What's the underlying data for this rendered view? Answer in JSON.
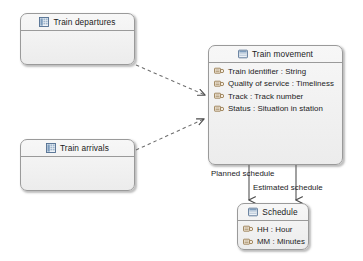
{
  "diagram": {
    "type": "uml-class-diagram",
    "background": "#ffffff",
    "box_fill": "#f0f0f0",
    "box_stroke": "#9a9a9a",
    "text_color": "#1b1b1b"
  },
  "classes": [
    {
      "id": "train-departures",
      "name": "Train departures",
      "icon": "table-icon",
      "attributes": [],
      "x": 20,
      "y": 13,
      "w": 115,
      "h": 52
    },
    {
      "id": "train-arrivals",
      "name": "Train arrivals",
      "icon": "table-icon",
      "attributes": [],
      "x": 20,
      "y": 139,
      "w": 115,
      "h": 52
    },
    {
      "id": "train-movement",
      "name": "Train movement",
      "icon": "window-icon",
      "attributes": [
        "Train identifier : String",
        "Quality of service : Timeliness",
        "Track : Track number",
        "Status : Situation in station"
      ],
      "x": 208,
      "y": 45,
      "w": 135,
      "h": 120
    },
    {
      "id": "schedule",
      "name": "Schedule",
      "icon": "window-icon",
      "attributes": [
        "HH : Hour",
        "MM : Minutes"
      ],
      "x": 237,
      "y": 203,
      "w": 72,
      "h": 47
    }
  ],
  "edges": [
    {
      "id": "departures-to-movement",
      "kind": "dependency-dashed-arrow",
      "from": "train-departures",
      "to": "train-movement",
      "label": ""
    },
    {
      "id": "arrivals-to-movement",
      "kind": "dependency-dashed-arrow",
      "from": "train-arrivals",
      "to": "train-movement",
      "label": ""
    },
    {
      "id": "planned-schedule",
      "kind": "association-solid-arrow",
      "from": "train-movement",
      "to": "schedule",
      "label": "Planned schedule"
    },
    {
      "id": "estimated-schedule",
      "kind": "association-solid-arrow",
      "from": "train-movement",
      "to": "schedule",
      "label": "Estimated schedule"
    }
  ],
  "labels": {
    "planned_schedule": "Planned schedule",
    "estimated_schedule": "Estimated schedule"
  }
}
